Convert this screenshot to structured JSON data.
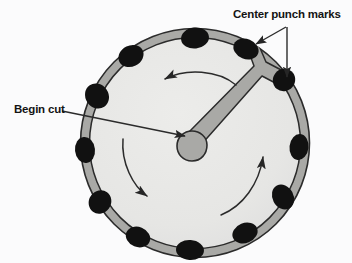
{
  "figure": {
    "title_visible": false,
    "background_color": "#fbfbfc",
    "labels": {
      "center_punch_marks": "Center punch marks",
      "begin_cut": "Begin cut"
    },
    "colors": {
      "disc_face": "#e8e8e6",
      "rim_band": "#a9a9a6",
      "punch_mark": "#111111",
      "outline": "#2b2b2b",
      "leader_line": "#2b2b2b",
      "cut_fill": "#a9a9a6"
    },
    "disc": {
      "center_x": 195,
      "center_y": 143,
      "outer_radius": 115,
      "inner_radius": 106,
      "rim_thickness": 9
    },
    "center_hub": {
      "center_x": 192,
      "center_y": 146,
      "radius": 14,
      "description": "starting drill blob where cut begins"
    },
    "cut_path": {
      "description": "tapered slot from center hub to rim forming a Y junction",
      "junction_x": 262,
      "junction_y": 70,
      "branch_end_upper": [
        251,
        47
      ],
      "branch_end_lower": [
        283,
        80
      ]
    },
    "punch_marks": [
      {
        "x": 195,
        "y": 38,
        "rx": 14,
        "ry": 11,
        "angle": -84
      },
      {
        "x": 246,
        "y": 49,
        "rx": 13,
        "ry": 10,
        "angle": -60
      },
      {
        "x": 283,
        "y": 80,
        "rx": 12,
        "ry": 10,
        "angle": -30
      },
      {
        "x": 299,
        "y": 146,
        "rx": 10,
        "ry": 13,
        "angle": 0
      },
      {
        "x": 283,
        "y": 197,
        "rx": 11,
        "ry": 13,
        "angle": 28
      },
      {
        "x": 245,
        "y": 233,
        "rx": 13,
        "ry": 10,
        "angle": 52
      },
      {
        "x": 190,
        "y": 250,
        "rx": 14,
        "ry": 10,
        "angle": 82
      },
      {
        "x": 138,
        "y": 237,
        "rx": 13,
        "ry": 10,
        "angle": 110
      },
      {
        "x": 100,
        "y": 202,
        "rx": 11,
        "ry": 12,
        "angle": 140
      },
      {
        "x": 85,
        "y": 150,
        "rx": 10,
        "ry": 13,
        "angle": 175
      },
      {
        "x": 96,
        "y": 96,
        "rx": 12,
        "ry": 13,
        "angle": 210
      },
      {
        "x": 130,
        "y": 56,
        "rx": 13,
        "ry": 10,
        "angle": 240
      }
    ],
    "rotation_arrows": [
      {
        "name": "top-arc-arrow",
        "direction": "counterclockwise",
        "from": [
          234,
          84
        ],
        "to": [
          163,
          79
        ]
      },
      {
        "name": "lower-left-arc-arrow",
        "direction": "counterclockwise",
        "from": [
          124,
          140
        ],
        "to": [
          149,
          198
        ]
      },
      {
        "name": "right-arc-arrow",
        "direction": "counterclockwise",
        "from": [
          222,
          214
        ],
        "to": [
          264,
          153
        ]
      }
    ],
    "leaders": [
      {
        "name": "center-punch-leader-diagonal",
        "from": [
          285,
          28
        ],
        "to": [
          254,
          45
        ]
      },
      {
        "name": "center-punch-leader-vertical",
        "from": [
          286,
          28
        ],
        "to": [
          287,
          79
        ]
      },
      {
        "name": "begin-cut-leader",
        "from": [
          61,
          111
        ],
        "to": [
          186,
          137
        ]
      }
    ]
  }
}
